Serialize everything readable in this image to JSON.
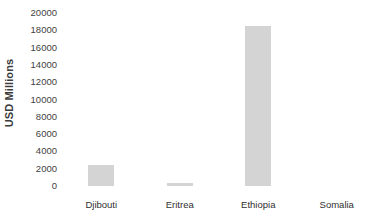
{
  "chart_data": {
    "type": "bar",
    "title": "",
    "subtitle": "",
    "xlabel": "",
    "ylabel": "USD Millions",
    "categories": [
      "Djibouti",
      "Eritrea",
      "Ethiopia",
      "Somalia"
    ],
    "values": [
      2400,
      300,
      18500,
      0
    ],
    "series": [
      {
        "name": "USD Millions",
        "values": [
          2400,
          300,
          18500,
          0
        ]
      }
    ],
    "ylim": [
      0,
      20000
    ],
    "ytick_labels": [
      "20000",
      "18000",
      "16000",
      "14000",
      "12000",
      "10000",
      "8000",
      "6000",
      "4000",
      "2000",
      "0"
    ],
    "ytick_values": [
      20000,
      18000,
      16000,
      14000,
      12000,
      10000,
      8000,
      6000,
      4000,
      2000,
      0
    ],
    "ytick_interval": 2000,
    "grid": false,
    "legend": false,
    "legend_position": "none",
    "annotations": [],
    "bar_color": "#d4d4d4",
    "background_color": "#ffffff",
    "axis_text_color": "#3f3f3f"
  }
}
